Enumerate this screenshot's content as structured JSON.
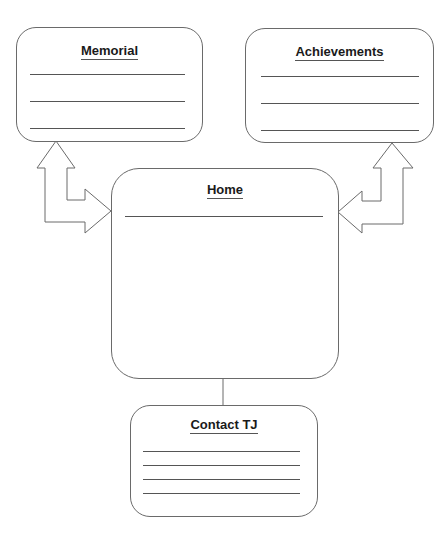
{
  "diagram": {
    "type": "sitemap-wireframe",
    "boxes": {
      "memorial": {
        "title": "Memorial",
        "line_count": 3
      },
      "achievements": {
        "title": "Achievements",
        "line_count": 3
      },
      "home": {
        "title": "Home",
        "line_count": 1
      },
      "contact": {
        "title": "Contact TJ",
        "line_count": 4
      }
    },
    "connections": [
      {
        "from": "home",
        "to": "memorial",
        "style": "double-headed block arrow"
      },
      {
        "from": "home",
        "to": "achievements",
        "style": "double-headed block arrow"
      },
      {
        "from": "home",
        "to": "contact",
        "style": "line"
      }
    ],
    "colors": {
      "stroke": "#6a6a6a",
      "text": "#1a1a1a",
      "background": "#ffffff"
    }
  }
}
